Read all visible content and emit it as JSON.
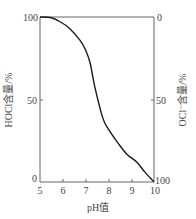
{
  "chart_data": {
    "type": "line",
    "title": "",
    "xlabel": "pH值",
    "ylabel": "HOCl含量/%",
    "ylabel_right": "OCl⁻含量/%",
    "xlim": [
      5,
      10
    ],
    "ylim": [
      0,
      100
    ],
    "ylim_right": [
      100,
      0
    ],
    "grid": false,
    "legend": null,
    "x_ticks": [
      "5",
      "6",
      "7",
      "8",
      "9",
      "10"
    ],
    "y_ticks": [
      "0",
      "50",
      "100"
    ],
    "y_ticks_right": [
      "100",
      "50",
      "0"
    ],
    "series": [
      {
        "name": "HOCl含量",
        "x": [
          5.0,
          5.5,
          5.9,
          6.3,
          6.75,
          7.0,
          7.2,
          7.4,
          7.75,
          8.0,
          8.4,
          8.8,
          9.25,
          9.6,
          10.0
        ],
        "y": [
          100,
          99.5,
          97,
          93,
          86,
          80,
          72,
          58,
          39,
          32,
          24,
          17,
          12,
          6,
          0
        ]
      }
    ]
  },
  "labels": {
    "x_title": "pH值",
    "y_left_title": "HOCl含量/%",
    "y_right_title": "OCl⁻含量/%",
    "x_ticks": [
      "5",
      "6",
      "7",
      "8",
      "9",
      "10"
    ],
    "y_left": {
      "top": "100",
      "mid": "50",
      "bottom": "0"
    },
    "y_right": {
      "top": "0",
      "mid": "50",
      "bottom": "100"
    }
  },
  "colors": {
    "axis": "#555555",
    "curve": "#1a1a1a",
    "text": "#444444"
  }
}
